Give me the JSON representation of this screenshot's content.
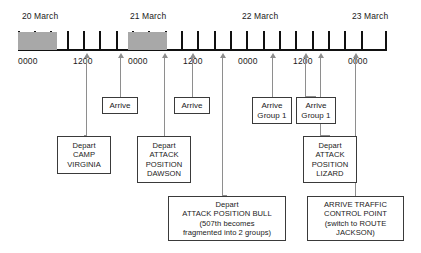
{
  "chart_data": {
    "type": "timeline",
    "title": "",
    "xlabel": "",
    "ylabel": "",
    "grid": false,
    "legend": null,
    "axis": {
      "start_label": "0000",
      "end_label": "0000",
      "tick_count": 23,
      "tick_interval_hours": 3,
      "range_hours": [
        0,
        72
      ]
    },
    "date_labels": [
      {
        "text": "20 March",
        "x": 22
      },
      {
        "text": "21 March",
        "x": 130
      },
      {
        "text": "22 March",
        "x": 242
      },
      {
        "text": "23 March",
        "x": 352
      }
    ],
    "time_labels": [
      {
        "text": "0000",
        "x": 18
      },
      {
        "text": "1200",
        "x": 73
      },
      {
        "text": "0000",
        "x": 128
      },
      {
        "text": "1200",
        "x": 183
      },
      {
        "text": "0000",
        "x": 238
      },
      {
        "text": "1200",
        "x": 293
      },
      {
        "text": "0000",
        "x": 348
      }
    ],
    "shaded_periods": [
      {
        "label": "night",
        "x_start": 18,
        "x_end": 57
      },
      {
        "label": "night",
        "x_start": 128,
        "x_end": 167
      }
    ],
    "ticks_x": [
      18,
      34,
      50,
      67,
      83,
      99,
      116,
      132,
      148,
      165,
      181,
      197,
      214,
      230,
      246,
      263,
      279,
      295,
      312,
      328,
      344,
      361,
      385
    ],
    "events": [
      {
        "id": "depart-camp-virginia",
        "anchor_x": 86,
        "lines": [
          "Depart",
          "CAMP",
          "VIRGINIA"
        ],
        "box": {
          "x": 57,
          "y": 136,
          "w": 54,
          "h": 38
        }
      },
      {
        "id": "arrive-1",
        "anchor_x": 120,
        "lines": [
          "Arrive"
        ],
        "box": {
          "x": 102,
          "y": 97,
          "w": 36,
          "h": 17
        }
      },
      {
        "id": "depart-attack-position-dawson",
        "anchor_x": 164,
        "lines": [
          "Depart",
          "ATTACK",
          "POSITION",
          "DAWSON"
        ],
        "box": {
          "x": 137,
          "y": 136,
          "w": 54,
          "h": 47
        }
      },
      {
        "id": "arrive-2",
        "anchor_x": 192,
        "lines": [
          "Arrive"
        ],
        "box": {
          "x": 174,
          "y": 97,
          "w": 36,
          "h": 17
        }
      },
      {
        "id": "depart-attack-position-bull",
        "anchor_x": 222,
        "lines": [
          "Depart",
          "ATTACK POSITION BULL",
          "(507th becomes",
          "fragmented into 2 groups)"
        ],
        "box": {
          "x": 168,
          "y": 196,
          "w": 118,
          "h": 45
        }
      },
      {
        "id": "arrive-group-1-a",
        "anchor_x": 272,
        "lines": [
          "Arrive",
          "Group 1"
        ],
        "box": {
          "x": 252,
          "y": 97,
          "w": 40,
          "h": 27
        }
      },
      {
        "id": "arrive-group-1-b",
        "anchor_x": 305,
        "lines": [
          "Arrive",
          "Group 1"
        ],
        "box": {
          "x": 296,
          "y": 97,
          "w": 40,
          "h": 27
        }
      },
      {
        "id": "depart-attack-position-lizard",
        "anchor_x": 320,
        "lines": [
          "Depart",
          "ATTACK",
          "POSITION",
          "LIZARD"
        ],
        "box": {
          "x": 303,
          "y": 136,
          "w": 54,
          "h": 47
        }
      },
      {
        "id": "arrive-traffic-control-point",
        "anchor_x": 355,
        "lines": [
          "ARRIVE TRAFFIC",
          "CONTROL POINT",
          "(switch to ROUTE",
          "JACKSON)"
        ],
        "box": {
          "x": 307,
          "y": 196,
          "w": 97,
          "h": 45
        }
      }
    ]
  },
  "colors": {
    "axis": "#111111",
    "shade": "#a8a8a8",
    "leader": "#8e8e8e",
    "box_border": "#3a3a3a",
    "background": "#ffffff",
    "text": "#1a1a1a"
  }
}
